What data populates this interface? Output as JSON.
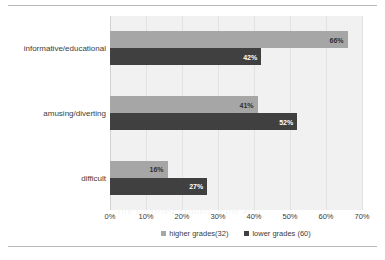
{
  "chart_data": {
    "type": "bar",
    "orientation": "horizontal",
    "title": "",
    "xlabel": "",
    "ylabel": "",
    "categories": [
      "informative/educational",
      "amusing/diverting",
      "difficult"
    ],
    "series": [
      {
        "name": "higher grades(32)",
        "color": "#a6a6a6",
        "values": [
          66,
          41,
          16
        ],
        "labels": [
          "66%",
          "41%",
          "16%"
        ]
      },
      {
        "name": "lower grades (60)",
        "color": "#404040",
        "values": [
          42,
          52,
          27
        ],
        "labels": [
          "42%",
          "52%",
          "27%"
        ]
      }
    ],
    "xlim": [
      0,
      70
    ],
    "xticks": [
      0,
      10,
      20,
      30,
      40,
      50,
      60,
      70
    ],
    "xtick_labels": [
      "0%",
      "10%",
      "20%",
      "30%",
      "40%",
      "50%",
      "60%",
      "70%"
    ],
    "grid": true,
    "legend_position": "bottom",
    "plot_background": "#f1f1f1"
  },
  "legend": {
    "items": [
      {
        "label": "higher grades(32)"
      },
      {
        "label": "lower grades (60)"
      }
    ]
  },
  "background_text": {
    "lines": [
      "a ne possible in WnhimiSh to the",
      "as others applied their aspuration",
      "in accepting Govern of Can the",
      "nity ha riches and to their",
      "in the program at and that leave",
      "the supplied Studen te the ar"
    ]
  }
}
